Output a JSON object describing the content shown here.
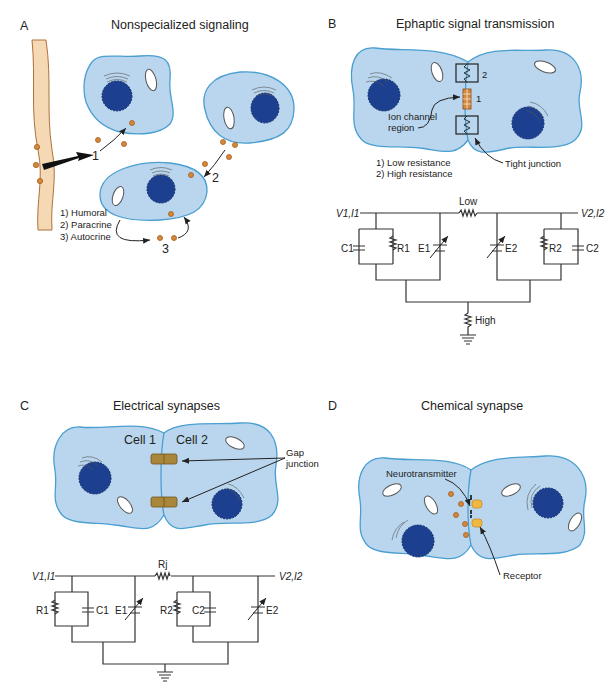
{
  "panels": [
    {
      "id": "A",
      "letter": "A",
      "title": "Nonspecialized signaling",
      "legend": [
        "1) Humoral",
        "2) Paracrine",
        "3) Autocrine"
      ],
      "markers": [
        "1",
        "2",
        "3"
      ]
    },
    {
      "id": "B",
      "letter": "B",
      "title": "Ephaptic signal transmission",
      "labels": {
        "ion_channel": [
          "Ion channel",
          "region"
        ],
        "tight_junction": "Tight junction",
        "marker_1": "1",
        "marker_2": "2"
      },
      "legend": [
        "1) Low resistance",
        "2) High resistance"
      ],
      "circuit": {
        "left_terminal": "V1,I1",
        "right_terminal": "V2,I2",
        "coupling_resistor": "Low",
        "ground_resistor": "High",
        "components": [
          "C1",
          "R1",
          "E1",
          "E2",
          "R2",
          "C2"
        ]
      }
    },
    {
      "id": "C",
      "letter": "C",
      "title": "Electrical synapses",
      "labels": {
        "cell1": "Cell 1",
        "cell2": "Cell 2",
        "gap_junction": [
          "Gap",
          "junction"
        ]
      },
      "circuit": {
        "left_terminal": "V1,I1",
        "right_terminal": "V2,I2",
        "coupling_resistor": "Rj",
        "components": [
          "R1",
          "C1",
          "E1",
          "R2",
          "C2",
          "E2"
        ]
      }
    },
    {
      "id": "D",
      "letter": "D",
      "title": "Chemical synapse",
      "labels": {
        "neurotransmitter": "Neurotransmitter",
        "receptor": "Receptor"
      }
    }
  ],
  "colors": {
    "cell_fill": "#b9d6ee",
    "cell_outline": "#4a9fd0",
    "nucleus": "#1d3f8f",
    "signal_molecule": "#d48a3a",
    "vessel": "#f5d9b5",
    "gap_junction": "#a8863a",
    "receptor": "#f0b840"
  }
}
